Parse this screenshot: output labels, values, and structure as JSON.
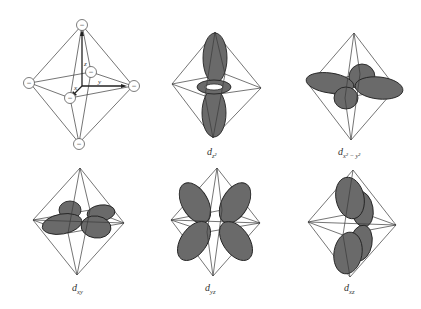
{
  "figure": {
    "panels": [
      {
        "id": "ligand-field",
        "label": "",
        "axes": {
          "x": "x",
          "y": "y",
          "z": "z"
        },
        "ligand_charge": "−",
        "ligand_count": 6
      },
      {
        "id": "dz2",
        "label_base": "d",
        "label_sub": "z²"
      },
      {
        "id": "dx2-y2",
        "label_base": "d",
        "label_sub": "x² − y²"
      },
      {
        "id": "dxy",
        "label_base": "d",
        "label_sub": "xy"
      },
      {
        "id": "dyz",
        "label_base": "d",
        "label_sub": "yz"
      },
      {
        "id": "dxz",
        "label_base": "d",
        "label_sub": "xz"
      }
    ],
    "colors": {
      "lobe_fill": "#6a6a6a",
      "edge": "#3a3a3a",
      "background": "#ffffff"
    }
  }
}
